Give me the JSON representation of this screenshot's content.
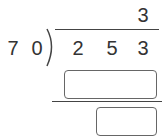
{
  "problem": {
    "divisor": [
      "7",
      "0"
    ],
    "dividend": [
      "2",
      "5",
      "3"
    ],
    "quotient": [
      "3"
    ]
  },
  "answer_boxes": [
    {
      "name": "product-box",
      "value": ""
    },
    {
      "name": "remainder-box",
      "value": ""
    }
  ]
}
